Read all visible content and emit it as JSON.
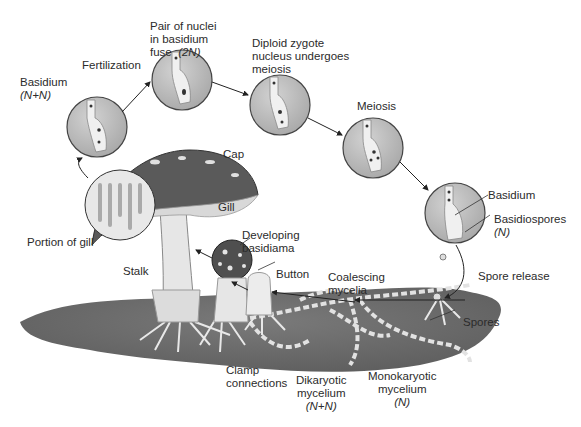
{
  "diagram": {
    "colors": {
      "background": "#ffffff",
      "soil": "#6e6e6e",
      "circle_fill": "#bdbdbd",
      "cap": "#555555",
      "text": "#2b2b2b"
    },
    "stages": [
      {
        "id": "basidium-nn",
        "label": "Basidium",
        "sub": "(N+N)"
      },
      {
        "id": "fertilization",
        "label": "Fertilization"
      },
      {
        "id": "nuclei-fuse",
        "line1": "Pair of nuclei",
        "line2": "in basidium",
        "line3": "fuse",
        "sub": "(2N)"
      },
      {
        "id": "zygote-meiosis",
        "line1": "Diploid zygote",
        "line2": "nucleus undergoes",
        "line3": "meiosis"
      },
      {
        "id": "meiosis",
        "label": "Meiosis"
      },
      {
        "id": "basidium",
        "label": "Basidium"
      },
      {
        "id": "basidiospores",
        "label": "Basidiospores",
        "sub": "(N)"
      },
      {
        "id": "spore-release",
        "label": "Spore release"
      }
    ],
    "structures": {
      "cap": "Cap",
      "gill": "Gill",
      "portion_of_gill": "Portion of gill",
      "stalk": "Stalk",
      "developing_1": "Developing",
      "developing_2": "basidiama",
      "button": "Button",
      "coalescing_1": "Coalescing",
      "coalescing_2": "mycelia",
      "spores": "Spores",
      "clamp_1": "Clamp",
      "clamp_2": "connections",
      "dikaryotic_1": "Dikaryotic",
      "dikaryotic_2": "mycelium",
      "dikaryotic_sub": "(N+N)",
      "monokaryotic_1": "Monokaryotic",
      "monokaryotic_2": "mycelium",
      "monokaryotic_sub": "(N)"
    }
  }
}
